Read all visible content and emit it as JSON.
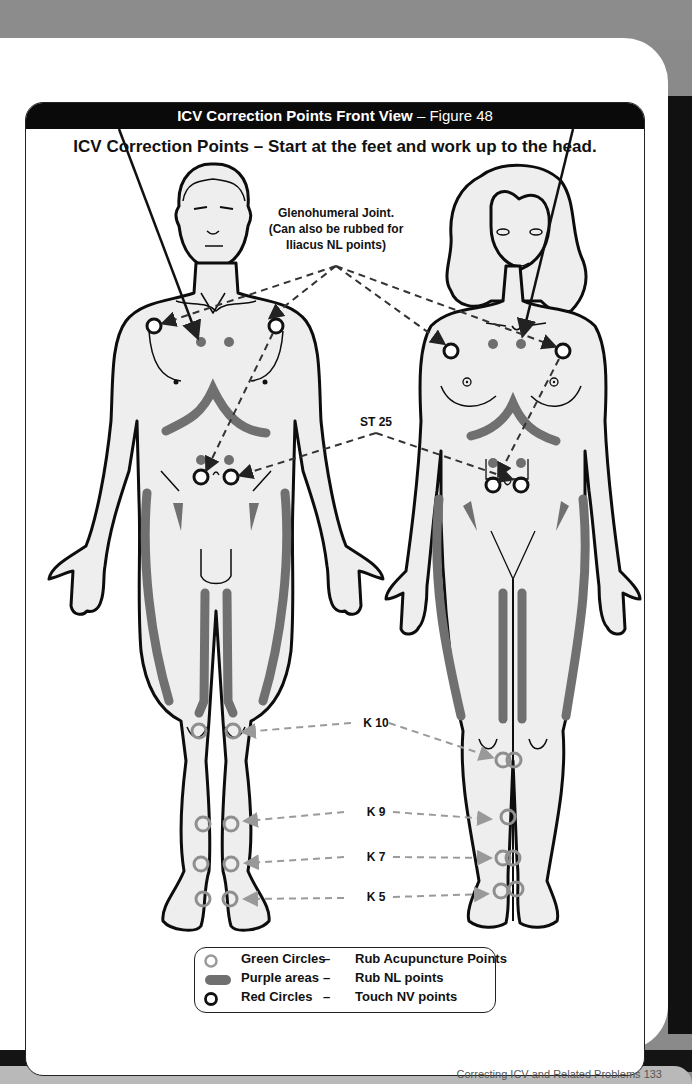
{
  "header": {
    "title_bold": "ICV Correction Points Front View",
    "title_separator": " – ",
    "title_figure": "Figure 48"
  },
  "subtitle": "ICV Correction Points – Start at the feet and work up to the head.",
  "labels": {
    "glenohumeral": [
      "Glenohumeral Joint.",
      "(Can also be rubbed for",
      "Iliacus NL points)"
    ],
    "st25": "ST 25",
    "k10": "K 10",
    "k9": "K 9",
    "k7": "K 7",
    "k5": "K 5"
  },
  "legend": {
    "items": [
      {
        "name": "Green Circles",
        "dash": "–",
        "desc": "Rub Acupuncture Points",
        "swatch": "ring-grey"
      },
      {
        "name": "Purple areas",
        "dash": "–",
        "desc": "Rub NL points",
        "swatch": "bar-grey"
      },
      {
        "name": "Red Circles",
        "dash": "–",
        "desc": "Touch NV points",
        "swatch": "ring-black"
      }
    ]
  },
  "colors": {
    "header_bg": "#0a0a0a",
    "acupuncture_ring": "#8f8f8f",
    "nl_area": "#6f6f6f",
    "nv_ring": "#111111",
    "skin": "#eeeeee",
    "outline": "#0d0d0d"
  },
  "footer": {
    "text": "Correcting ICV and Related Problems  133"
  }
}
